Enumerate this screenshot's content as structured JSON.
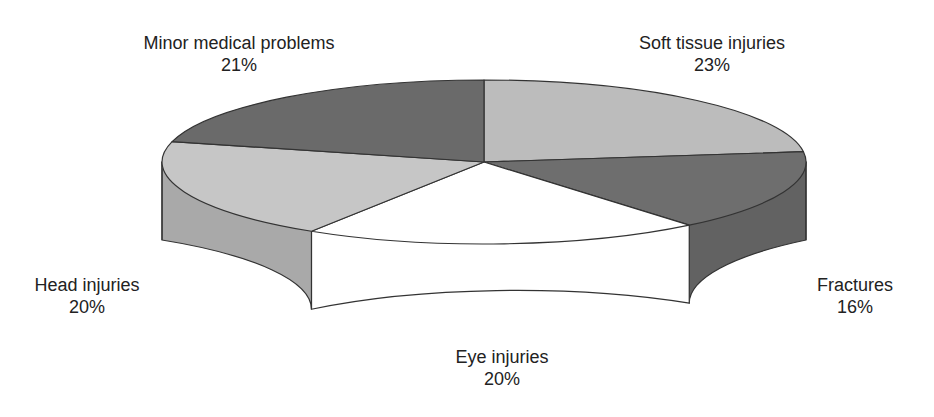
{
  "chart_data": {
    "type": "pie",
    "style": "3d-cylinder",
    "title": "",
    "categories": [
      "Soft tissue injuries",
      "Fractures",
      "Eye injuries",
      "Head injuries",
      "Minor medical problems"
    ],
    "values": [
      23,
      16,
      20,
      20,
      21
    ],
    "value_labels": [
      "23%",
      "16%",
      "20%",
      "20%",
      "21%"
    ],
    "legend": "none (direct labels)",
    "start_angle_deg": 90,
    "direction": "clockwise"
  },
  "slices": [
    {
      "name": "Soft tissue injuries",
      "percent_label": "23%",
      "value": 23,
      "top_color": "#bcbcbc",
      "side_color": "#a6a6a6"
    },
    {
      "name": "Fractures",
      "percent_label": "16%",
      "value": 16,
      "top_color": "#6e6e6e",
      "side_color": "#626262"
    },
    {
      "name": "Eye injuries",
      "percent_label": "20%",
      "value": 20,
      "top_color": "#ffffff",
      "side_color": "#ffffff"
    },
    {
      "name": "Head injuries",
      "percent_label": "20%",
      "value": 20,
      "top_color": "#c6c6c6",
      "side_color": "#a9a9a9"
    },
    {
      "name": "Minor medical problems",
      "percent_label": "21%",
      "value": 21,
      "top_color": "#6a6a6a",
      "side_color": "#5e5e5e"
    }
  ],
  "geometry": {
    "cx": 484,
    "cy": 162,
    "rx": 322,
    "ry": 82,
    "depth": 78,
    "outline_color": "#333333"
  },
  "labels": [
    {
      "key": "minor",
      "name": "Minor medical problems",
      "percent": "21%",
      "x": 239,
      "y": 32
    },
    {
      "key": "soft",
      "name": "Soft tissue injuries",
      "percent": "23%",
      "x": 712,
      "y": 32
    },
    {
      "key": "head",
      "name": "Head injuries",
      "percent": "20%",
      "x": 87,
      "y": 274
    },
    {
      "key": "fractures",
      "name": "Fractures",
      "percent": "16%",
      "x": 855,
      "y": 274
    },
    {
      "key": "eye",
      "name": "Eye injuries",
      "percent": "20%",
      "x": 502,
      "y": 346
    }
  ]
}
